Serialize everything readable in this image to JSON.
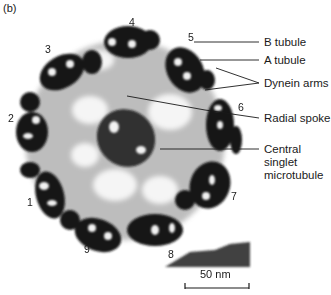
{
  "figure": {
    "panel_label": "(b)",
    "doublet_numbers": [
      "1",
      "2",
      "3",
      "4",
      "5",
      "6",
      "7",
      "8",
      "9"
    ],
    "labels": {
      "b_tubule": "B tubule",
      "a_tubule": "A tubule",
      "dynein_arms": "Dynein arms",
      "radial_spoke": "Radial spoke",
      "central_line1": "Central",
      "central_line2": "singlet",
      "central_line3": "microtubule"
    },
    "scale_bar": {
      "label": "50 nm"
    },
    "colors": {
      "ink": "#1a1a1a",
      "background": "#ffffff",
      "haze": "#9a9a9a"
    }
  }
}
